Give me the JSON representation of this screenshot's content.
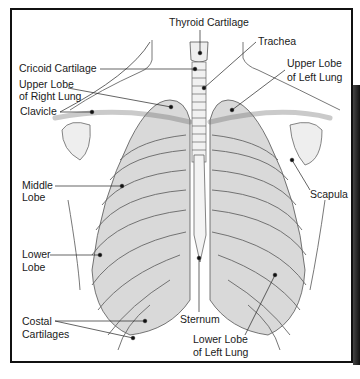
{
  "diagram": {
    "labels": {
      "thyroid_cartilage": "Thyroid Cartilage",
      "trachea": "Trachea",
      "cricoid_cartilage": "Cricoid Cartilage",
      "upper_lobe_right": [
        "Upper Lobe",
        "of Right Lung"
      ],
      "upper_lobe_left": [
        "Upper Lobe",
        "of Left Lung"
      ],
      "clavicle": "Clavicle",
      "middle_lobe": [
        "Middle",
        "Lobe"
      ],
      "scapula": "Scapula",
      "lower_lobe": [
        "Lower",
        "Lobe"
      ],
      "costal_cartilages": [
        "Costal",
        "Cartilages"
      ],
      "sternum": "Sternum",
      "lower_lobe_left": [
        "Lower Lobe",
        "of Left Lung"
      ]
    },
    "colors": {
      "ink": "#1a1a1a",
      "lung_fill": "#d6d6d6",
      "bone_fill": "#efefef",
      "outline": "#555555"
    }
  }
}
